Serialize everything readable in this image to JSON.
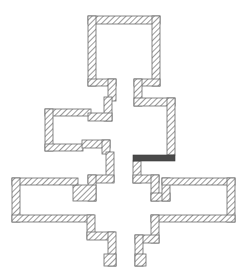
{
  "diagram": {
    "type": "floor-plan",
    "background": "#ffffff",
    "wall_style": {
      "pattern": "diagonal-hatch",
      "stroke": "#6a6a6a",
      "hatch_color": "#555555"
    },
    "walls": [
      {
        "id": "top-room-top",
        "x": 88,
        "y": 16,
        "w": 72,
        "h": 8
      },
      {
        "id": "top-room-left",
        "x": 88,
        "y": 16,
        "w": 8,
        "h": 70
      },
      {
        "id": "top-room-right",
        "x": 152,
        "y": 16,
        "w": 8,
        "h": 70
      },
      {
        "id": "top-room-bottom-left",
        "x": 88,
        "y": 79,
        "w": 28,
        "h": 7
      },
      {
        "id": "top-room-bottom-right",
        "x": 134,
        "y": 79,
        "w": 26,
        "h": 7
      },
      {
        "id": "neck-left-upper",
        "x": 108,
        "y": 79,
        "w": 8,
        "h": 22
      },
      {
        "id": "neck-left-lower",
        "x": 104,
        "y": 97,
        "w": 8,
        "h": 24
      },
      {
        "id": "neck-right",
        "x": 134,
        "y": 79,
        "w": 8,
        "h": 27
      },
      {
        "id": "right-corridor-top",
        "x": 134,
        "y": 98,
        "w": 41,
        "h": 8
      },
      {
        "id": "right-corridor-wall",
        "x": 167,
        "y": 98,
        "w": 8,
        "h": 57
      },
      {
        "id": "left-room-top",
        "x": 45,
        "y": 109,
        "w": 46,
        "h": 7
      },
      {
        "id": "left-room-step",
        "x": 88,
        "y": 113,
        "w": 24,
        "h": 8
      },
      {
        "id": "left-room-left",
        "x": 45,
        "y": 109,
        "w": 8,
        "h": 42
      },
      {
        "id": "left-room-bottom",
        "x": 45,
        "y": 144,
        "w": 38,
        "h": 7
      },
      {
        "id": "left-room-bottom-step",
        "x": 82,
        "y": 140,
        "w": 28,
        "h": 8
      },
      {
        "id": "left-room-right-a",
        "x": 102,
        "y": 140,
        "w": 8,
        "h": 14
      },
      {
        "id": "left-room-right-b",
        "x": 106,
        "y": 152,
        "w": 8,
        "h": 30
      },
      {
        "id": "left-connector-a",
        "x": 88,
        "y": 175,
        "w": 26,
        "h": 8
      },
      {
        "id": "left-connector-b",
        "x": 88,
        "y": 175,
        "w": 8,
        "h": 26
      },
      {
        "id": "left-connector-c",
        "x": 73,
        "y": 185,
        "w": 23,
        "h": 16
      },
      {
        "id": "big-left-top",
        "x": 12,
        "y": 178,
        "w": 66,
        "h": 7
      },
      {
        "id": "big-left-left",
        "x": 12,
        "y": 178,
        "w": 8,
        "h": 44
      },
      {
        "id": "big-left-bottom",
        "x": 12,
        "y": 215,
        "w": 82,
        "h": 7
      },
      {
        "id": "big-left-lower-a",
        "x": 87,
        "y": 215,
        "w": 8,
        "h": 24
      },
      {
        "id": "big-left-lower-b",
        "x": 87,
        "y": 232,
        "w": 28,
        "h": 8
      },
      {
        "id": "big-left-lower-c",
        "x": 108,
        "y": 232,
        "w": 8,
        "h": 34
      },
      {
        "id": "big-left-lower-d",
        "x": 104,
        "y": 254,
        "w": 12,
        "h": 12
      },
      {
        "id": "right-lower-a",
        "x": 133,
        "y": 161,
        "w": 8,
        "h": 22
      },
      {
        "id": "right-lower-b",
        "x": 133,
        "y": 175,
        "w": 26,
        "h": 8
      },
      {
        "id": "right-lower-c",
        "x": 151,
        "y": 175,
        "w": 8,
        "h": 26
      },
      {
        "id": "right-lower-d",
        "x": 151,
        "y": 193,
        "w": 19,
        "h": 8
      },
      {
        "id": "right-lower-e",
        "x": 162,
        "y": 178,
        "w": 8,
        "h": 23
      },
      {
        "id": "big-right-top",
        "x": 162,
        "y": 178,
        "w": 73,
        "h": 7
      },
      {
        "id": "big-right-right",
        "x": 227,
        "y": 178,
        "w": 8,
        "h": 44
      },
      {
        "id": "big-right-bottom",
        "x": 151,
        "y": 215,
        "w": 84,
        "h": 7
      },
      {
        "id": "big-right-lower-a",
        "x": 151,
        "y": 215,
        "w": 8,
        "h": 28
      },
      {
        "id": "big-right-lower-b",
        "x": 135,
        "y": 235,
        "w": 24,
        "h": 8
      },
      {
        "id": "big-right-lower-c",
        "x": 135,
        "y": 235,
        "w": 8,
        "h": 31
      },
      {
        "id": "big-right-lower-d",
        "x": 135,
        "y": 254,
        "w": 11,
        "h": 12
      }
    ],
    "doors": [
      {
        "id": "dark-door",
        "x": 133,
        "y": 155,
        "w": 42,
        "h": 6,
        "color": "#4a4a4a"
      }
    ]
  }
}
